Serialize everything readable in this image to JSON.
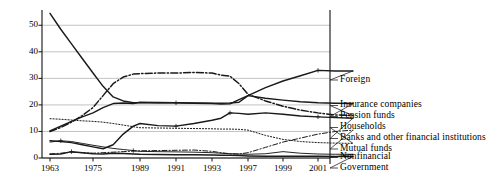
{
  "chart_data": {
    "type": "line",
    "title": "",
    "xlabel": "",
    "ylabel": "",
    "xlim": [
      1963,
      2003
    ],
    "ylim": [
      0,
      55
    ],
    "grid": true,
    "legend_position": "right-outside",
    "yticks": [
      0,
      10,
      20,
      30,
      40,
      50
    ],
    "xticks": [
      1963,
      1975,
      1989,
      1991,
      1993,
      1997,
      1999,
      2001
    ],
    "x": [
      1963,
      1966,
      1969,
      1972,
      1975,
      1978,
      1981,
      1984,
      1987,
      1989,
      1990,
      1991,
      1992,
      1993,
      1994,
      1995,
      1996,
      1997,
      1998,
      1999,
      2000,
      2001,
      2002,
      2003
    ],
    "series": [
      {
        "name": "Foreign",
        "style": "solid",
        "values": [
          54.5,
          48.5,
          43.0,
          37.5,
          32.0,
          27.0,
          23.0,
          21.5,
          20.8,
          20.8,
          20.9,
          20.8,
          20.6,
          20.5,
          20.3,
          20.4,
          22.0,
          23.5,
          26.5,
          29.0,
          31.0,
          33.0,
          32.8,
          32.8
        ]
      },
      {
        "name": "Insurance companies",
        "style": "dash-dot",
        "values": [
          10.0,
          11.5,
          13.5,
          16.0,
          19.0,
          23.5,
          28.0,
          30.5,
          31.6,
          31.8,
          32.0,
          32.0,
          32.2,
          32.0,
          31.2,
          30.8,
          28.0,
          24.0,
          21.5,
          19.5,
          18.0,
          17.0,
          16.2,
          16.0
        ]
      },
      {
        "name": "Pension funds",
        "style": "solid",
        "values": [
          10.2,
          12.0,
          13.8,
          15.5,
          17.0,
          19.0,
          20.5,
          20.7,
          20.5,
          21.0,
          20.8,
          20.8,
          20.7,
          20.6,
          20.6,
          20.7,
          21.0,
          23.5,
          22.5,
          21.8,
          21.2,
          20.8,
          20.6,
          20.5
        ]
      },
      {
        "name": "Households",
        "style": "dotted",
        "values": [
          14.8,
          14.6,
          14.3,
          14.0,
          13.8,
          13.5,
          13.0,
          12.4,
          11.8,
          11.4,
          11.3,
          11.2,
          11.1,
          11.0,
          10.9,
          10.9,
          10.8,
          10.5,
          8.5,
          7.0,
          6.2,
          5.8,
          5.6,
          5.5
        ]
      },
      {
        "name": "Banks and other financial institutions",
        "style": "solid",
        "values": [
          6.5,
          6.2,
          5.8,
          5.0,
          4.2,
          3.5,
          5.0,
          9.0,
          12.0,
          13.0,
          12.2,
          12.0,
          13.0,
          14.2,
          15.0,
          17.0,
          16.8,
          16.5,
          17.0,
          16.5,
          15.8,
          15.5,
          15.2,
          15.0
        ]
      },
      {
        "name": "Mutual funds",
        "style": "dash-dot-thin",
        "values": [
          1.5,
          1.8,
          2.2,
          2.0,
          1.8,
          2.0,
          2.2,
          2.4,
          2.6,
          2.7,
          2.8,
          2.9,
          3.0,
          2.5,
          2.0,
          1.6,
          1.5,
          2.0,
          4.0,
          6.0,
          7.5,
          9.0,
          10.0,
          10.5
        ]
      },
      {
        "name": "Nonfinancial",
        "style": "solid-thin",
        "values": [
          6.0,
          6.5,
          6.2,
          5.5,
          4.8,
          4.2,
          3.6,
          3.2,
          2.8,
          2.5,
          2.4,
          2.3,
          2.2,
          2.0,
          1.8,
          1.6,
          1.5,
          1.4,
          1.6,
          2.4,
          1.8,
          1.5,
          1.4,
          1.4
        ]
      },
      {
        "name": "Government",
        "style": "solid-flat",
        "values": [
          1.4,
          1.5,
          2.4,
          2.0,
          1.6,
          1.5,
          1.8,
          1.7,
          1.5,
          1.4,
          1.3,
          1.2,
          1.2,
          1.1,
          1.0,
          1.0,
          0.9,
          0.8,
          0.7,
          0.7,
          0.7,
          0.7,
          0.6,
          0.6
        ]
      }
    ]
  },
  "axis": {
    "ytick_labels": [
      "50",
      "40",
      "30",
      "20",
      "10",
      "0"
    ],
    "xtick_labels": [
      "1963",
      "1975",
      "1989",
      "1991",
      "1993",
      "1997",
      "1999",
      "2001"
    ]
  },
  "legend": {
    "items": [
      {
        "label": "Foreign"
      },
      {
        "label": "Insurance companies"
      },
      {
        "label": "Pension funds"
      },
      {
        "label": "Households"
      },
      {
        "label": "Banks and other financial institutions"
      },
      {
        "label": "Mutual funds"
      },
      {
        "label": "Nonfinancial"
      },
      {
        "label": "Government"
      }
    ]
  },
  "colors": {
    "line": "#1a1a1a",
    "grid": "#a8a8a8",
    "axis": "#111111",
    "background": "#ffffff"
  }
}
